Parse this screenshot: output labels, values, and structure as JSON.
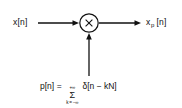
{
  "figure": {
    "type": "block-diagram",
    "background_color": "#ffffff",
    "line_color": "#111111"
  },
  "input": {
    "label": "x[n]",
    "arrow": "right-arrow"
  },
  "multiplier": {
    "symbol": "×",
    "shape": "circle",
    "name": "multiplier-node"
  },
  "output": {
    "base": "x",
    "subscript": "p",
    "bracket": "[n]"
  },
  "impulse_train_input": {
    "arrow": "up-arrow"
  },
  "equation": {
    "lhs": "p[n]",
    "equals": "=",
    "sum_upper_limit": "+∞",
    "sigma": "Σ",
    "sum_lower_limit": "k = −∞",
    "rhs": "δ[n − kN]"
  }
}
